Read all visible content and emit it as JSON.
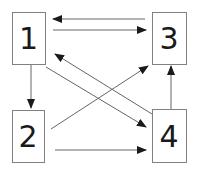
{
  "diagram": {
    "type": "directed-graph",
    "nodes": [
      {
        "id": "1",
        "label": "1",
        "x": 12,
        "y": 12,
        "w": 33,
        "h": 52
      },
      {
        "id": "2",
        "label": "2",
        "x": 12,
        "y": 110,
        "w": 32,
        "h": 52
      },
      {
        "id": "3",
        "label": "3",
        "x": 152,
        "y": 12,
        "w": 34,
        "h": 52
      },
      {
        "id": "4",
        "label": "4",
        "x": 152,
        "y": 109,
        "w": 34,
        "h": 53
      }
    ],
    "edges": [
      {
        "from": "3",
        "to": "1",
        "x1": 145,
        "y1": 19,
        "x2": 53,
        "y2": 19
      },
      {
        "from": "1",
        "to": "3",
        "x1": 53,
        "y1": 30,
        "x2": 146,
        "y2": 30
      },
      {
        "from": "1",
        "to": "2",
        "x1": 31,
        "y1": 65,
        "x2": 31,
        "y2": 108
      },
      {
        "from": "1",
        "to": "4",
        "x1": 46,
        "y1": 67,
        "x2": 146,
        "y2": 127
      },
      {
        "from": "4",
        "to": "1",
        "x1": 152,
        "y1": 114,
        "x2": 55,
        "y2": 54
      },
      {
        "from": "2",
        "to": "3",
        "x1": 51,
        "y1": 129,
        "x2": 148,
        "y2": 66
      },
      {
        "from": "2",
        "to": "4",
        "x1": 55,
        "y1": 150,
        "x2": 146,
        "y2": 150
      },
      {
        "from": "4",
        "to": "3",
        "x1": 171,
        "y1": 109,
        "x2": 171,
        "y2": 66
      }
    ]
  },
  "colors": {
    "box_stroke": "#808080",
    "edge_stroke": "#666666",
    "arrowhead": "#1a1a1a",
    "label": "#1a1a1a"
  }
}
